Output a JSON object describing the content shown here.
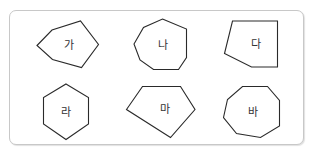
{
  "figure": {
    "shapes": [
      {
        "label": "가",
        "kind": "pentagon",
        "sides": 5,
        "points": "37,45.5 52,30 80.5,21 98.5,44.5 81.5,67.5 52.5,59.5",
        "label_pos": [
          69,
          45
        ]
      },
      {
        "label": "나",
        "kind": "heptagon",
        "sides": 7,
        "points": "162.5,19 186.5,29 186.5,57.5 178.5,69.5 153.5,69.5 140,60 134,44 143.5,27.5",
        "label_pos": [
          163,
          45
        ]
      },
      {
        "label": "다",
        "kind": "pentagon",
        "sides": 5,
        "points": "232.5,21 277.5,21 277.5,67 251.5,67 224.5,53.5",
        "label_pos": [
          256,
          44
        ]
      },
      {
        "label": "라",
        "kind": "hexagon",
        "sides": 6,
        "points": "66,84 88.5,97.5 88.5,124 66,139.5 43.5,124 43.5,97.5",
        "label_pos": [
          66,
          112
        ]
      },
      {
        "label": "마",
        "kind": "pentagon",
        "sides": 5,
        "points": "142.5,86.5 180.5,86.5 195,109.5 170.5,137.5 126.5,109.5",
        "label_pos": [
          165,
          109
        ]
      },
      {
        "label": "바",
        "kind": "octagon",
        "sides": 8,
        "points": "242.5,86.5 267.5,86.5 279.5,100.5 279.5,126 260.5,137.5 236.5,133.5 223.5,117.5 227.5,99.5",
        "label_pos": [
          253,
          112
        ]
      }
    ]
  },
  "colors": {
    "stroke": "#2a2a2a",
    "label": "#333333",
    "border": "#c8c8c8"
  }
}
